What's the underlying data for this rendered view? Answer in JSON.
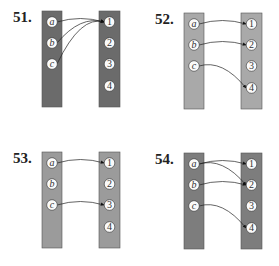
{
  "problems": [
    {
      "label": "51.",
      "domain": [
        "a",
        "b",
        "c"
      ],
      "codomain": [
        "1",
        "2",
        "3",
        "4"
      ],
      "mapping": [
        [
          "a",
          "1"
        ],
        [
          "b",
          "1"
        ],
        [
          "c",
          "1"
        ]
      ],
      "column_color": "#6b6b6b",
      "origin": [
        0,
        0
      ]
    },
    {
      "label": "52.",
      "domain": [
        "a",
        "b",
        "c"
      ],
      "codomain": [
        "1",
        "2",
        "3",
        "4"
      ],
      "mapping": [
        [
          "a",
          "1"
        ],
        [
          "b",
          "2"
        ],
        [
          "c",
          "4"
        ]
      ],
      "column_color": "#a9a9a9",
      "origin": [
        142,
        2
      ]
    },
    {
      "label": "53.",
      "domain": [
        "a",
        "b",
        "c"
      ],
      "codomain": [
        "1",
        "2",
        "3",
        "4"
      ],
      "mapping": [
        [
          "a",
          "1"
        ],
        [
          "c",
          "3"
        ]
      ],
      "column_color": "#9b9b9b",
      "origin": [
        0,
        141
      ]
    },
    {
      "label": "54.",
      "domain": [
        "a",
        "b",
        "c"
      ],
      "codomain": [
        "1",
        "2",
        "3",
        "4"
      ],
      "mapping": [
        [
          "a",
          "1"
        ],
        [
          "a",
          "2"
        ],
        [
          "b",
          "2"
        ],
        [
          "c",
          "4"
        ]
      ],
      "column_color": "#7d7d7d",
      "origin": [
        142,
        142
      ]
    }
  ]
}
